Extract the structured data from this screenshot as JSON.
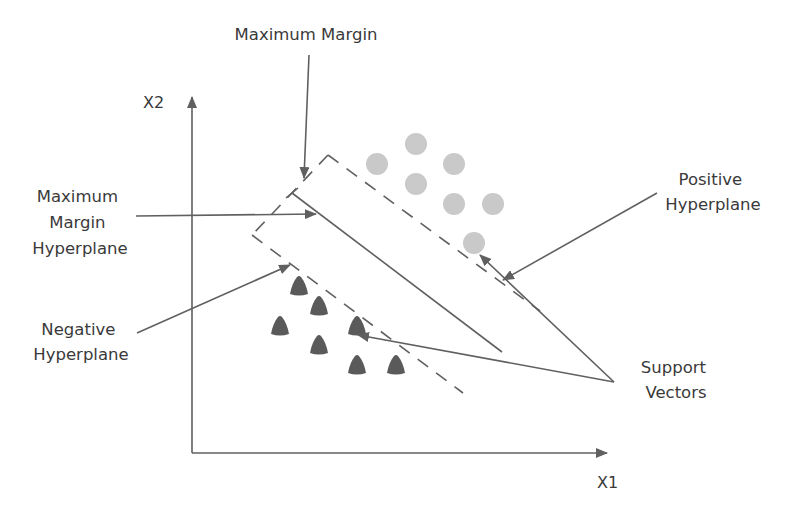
{
  "diagram": {
    "axes": {
      "x_label": "X1",
      "y_label": "X2"
    },
    "labels": {
      "maximum_margin": "Maximum Margin",
      "max_margin_hyperplane": [
        "Maximum",
        "Margin",
        "Hyperplane"
      ],
      "negative_hyperplane": [
        "Negative",
        "Hyperplane"
      ],
      "positive_hyperplane": [
        "Positive",
        "Hyperplane"
      ],
      "support_vectors": [
        "Support",
        "Vectors"
      ]
    },
    "colors": {
      "positive_class": "#c9c9c9",
      "negative_class": "#5a5a5a",
      "lines": "#606060",
      "text": "#3a3a3a"
    },
    "positive_class": {
      "shape": "circle",
      "points": [
        [
          377,
          164
        ],
        [
          416,
          144
        ],
        [
          454,
          164
        ],
        [
          416,
          184
        ],
        [
          454,
          204
        ],
        [
          493,
          204
        ],
        [
          474,
          243
        ]
      ],
      "support_vector_index": 6
    },
    "negative_class": {
      "shape": "triangle",
      "points": [
        [
          299,
          286
        ],
        [
          319,
          306
        ],
        [
          280,
          326
        ],
        [
          357,
          326
        ],
        [
          319,
          345
        ],
        [
          357,
          365
        ],
        [
          396,
          365
        ]
      ],
      "support_vector_index": 3
    }
  }
}
